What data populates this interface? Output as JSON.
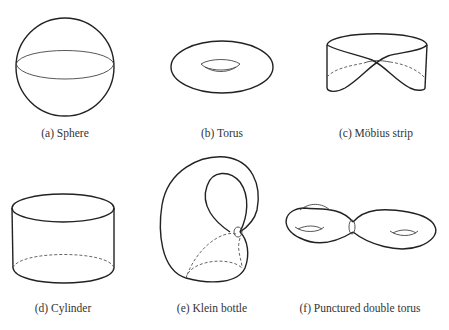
{
  "figure": {
    "panels": [
      {
        "id": "a",
        "label": "(a) Sphere",
        "surface": "sphere"
      },
      {
        "id": "b",
        "label": "(b) Torus",
        "surface": "torus"
      },
      {
        "id": "c",
        "label": "(c) Möbius strip",
        "surface": "mobius-strip"
      },
      {
        "id": "d",
        "label": "(d) Cylinder",
        "surface": "cylinder"
      },
      {
        "id": "e",
        "label": "(e) Klein bottle",
        "surface": "klein-bottle"
      },
      {
        "id": "f",
        "label": "(f) Punctured double torus",
        "surface": "punctured-double-torus"
      }
    ]
  }
}
